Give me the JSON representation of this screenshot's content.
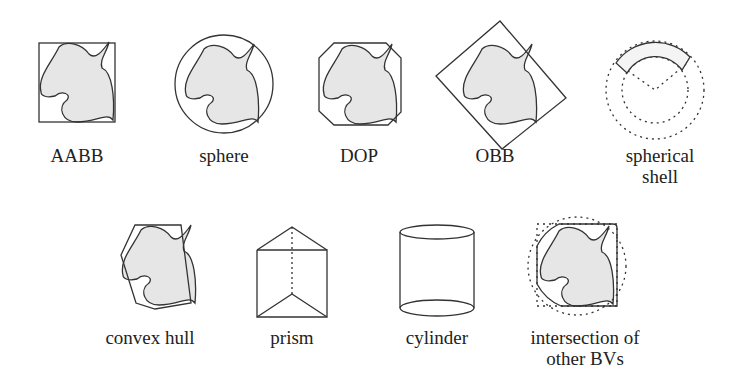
{
  "figure": {
    "top_row": [
      {
        "id": "aabb",
        "label": "AABB"
      },
      {
        "id": "sphere",
        "label": "sphere"
      },
      {
        "id": "dop",
        "label": "DOP"
      },
      {
        "id": "obb",
        "label": "OBB"
      },
      {
        "id": "spherical-shell",
        "label_line1": "spherical",
        "label_line2": "shell"
      }
    ],
    "bottom_row": [
      {
        "id": "convex-hull",
        "label": "convex hull"
      },
      {
        "id": "prism",
        "label": "prism"
      },
      {
        "id": "cylinder",
        "label": "cylinder"
      },
      {
        "id": "intersection",
        "label_line1": "intersection of",
        "label_line2": "other BVs"
      }
    ],
    "colors": {
      "stroke": "#333333",
      "fill": "#e6e6e6",
      "background": "#ffffff"
    }
  }
}
